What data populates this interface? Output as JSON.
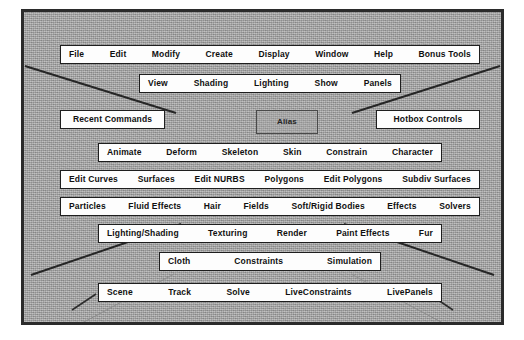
{
  "app": {
    "name": "Alias Maya Hotbox",
    "center_marker": "Alias"
  },
  "hotbox": {
    "rows": [
      {
        "id": "main-menu-row",
        "name": "main-menu-row",
        "items": [
          "File",
          "Edit",
          "Modify",
          "Create",
          "Display",
          "Window",
          "Help",
          "Bonus Tools"
        ]
      },
      {
        "id": "panel-menu-row",
        "name": "panel-menu-row",
        "items": [
          "View",
          "Shading",
          "Lighting",
          "Show",
          "Panels"
        ]
      },
      {
        "id": "animation-menu-row",
        "name": "animation-menu-row",
        "items": [
          "Animate",
          "Deform",
          "Skeleton",
          "Skin",
          "Constrain",
          "Character"
        ]
      },
      {
        "id": "modeling-menu-row",
        "name": "modeling-menu-row",
        "items": [
          "Edit Curves",
          "Surfaces",
          "Edit NURBS",
          "Polygons",
          "Edit Polygons",
          "Subdiv Surfaces"
        ]
      },
      {
        "id": "dynamics-menu-row",
        "name": "dynamics-menu-row",
        "items": [
          "Particles",
          "Fluid Effects",
          "Hair",
          "Fields",
          "Soft/Rigid Bodies",
          "Effects",
          "Solvers"
        ]
      },
      {
        "id": "rendering-menu-row",
        "name": "rendering-menu-row",
        "items": [
          "Lighting/Shading",
          "Texturing",
          "Render",
          "Paint Effects",
          "Fur"
        ]
      },
      {
        "id": "cloth-menu-row",
        "name": "cloth-menu-row",
        "items": [
          "Cloth",
          "Constraints",
          "Simulation"
        ]
      },
      {
        "id": "live-menu-row",
        "name": "live-menu-row",
        "items": [
          "Scene",
          "Track",
          "Solve",
          "LiveConstraints",
          "LivePanels"
        ]
      }
    ],
    "side_boxes": {
      "left_label": "Recent Commands",
      "right_label": "Hotbox Controls"
    }
  },
  "colors": {
    "hotbox_fill": "#fdfdfd",
    "hotbox_border": "#1e1e1e",
    "viewport_background": "#a8a8a8",
    "frame_border": "#2b2b2b",
    "grid_line": "#303030",
    "text": "#101010"
  }
}
